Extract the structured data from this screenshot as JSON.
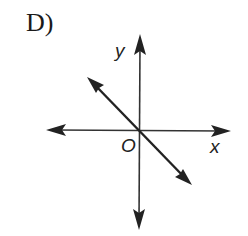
{
  "choice_label": "D)",
  "axes": {
    "x_label": "x",
    "y_label": "y",
    "origin_label": "O"
  },
  "line": {
    "description": "line through origin with negative slope",
    "slope_sign": "negative",
    "passes_through_origin": true
  },
  "colors": {
    "ink": "#222222",
    "background": "#ffffff"
  }
}
